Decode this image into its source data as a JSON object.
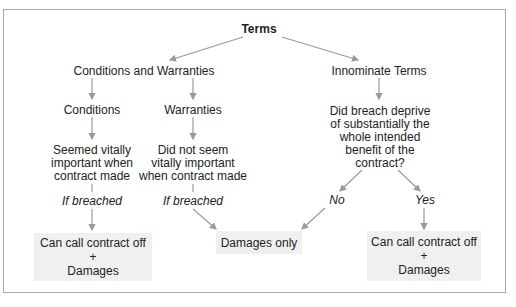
{
  "diagram": {
    "root": "Terms",
    "left_branch": {
      "title": "Conditions and Warranties",
      "conditions": {
        "label": "Conditions",
        "test_line1": "Seemed vitally",
        "test_line2": "important when",
        "test_line3": "contract made",
        "edge": "If breached"
      },
      "warranties": {
        "label": "Warranties",
        "test_line1": "Did not seem",
        "test_line2": "vitally important",
        "test_line3": "when contract made",
        "edge": "If breached"
      }
    },
    "right_branch": {
      "title": "Innominate Terms",
      "question_line1": "Did breach deprive",
      "question_line2": "of substantially the",
      "question_line3": "whole intended",
      "question_line4": "benefit of the",
      "question_line5": "contract?",
      "no_label": "No",
      "yes_label": "Yes"
    },
    "outcomes": {
      "left": {
        "line1": "Can call contract off",
        "line2": "+",
        "line3": "Damages"
      },
      "center": {
        "line1": "Damages only"
      },
      "right": {
        "line1": "Can call contract off",
        "line2": "+",
        "line3": "Damages"
      }
    },
    "colors": {
      "arrow": "#9a9a9a",
      "box_fill": "#f0f0f0",
      "frame": "#a8a8a8"
    }
  }
}
